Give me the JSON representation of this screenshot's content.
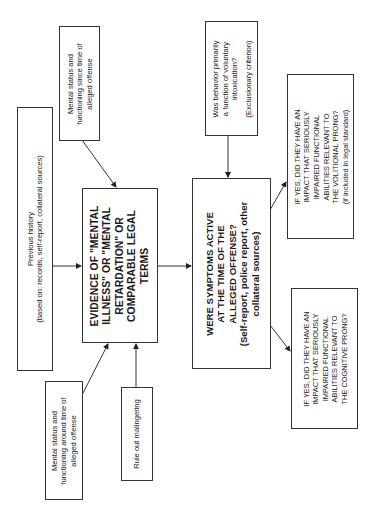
{
  "diagram": {
    "title": "",
    "orientation": "rotated-90-ccw",
    "nodes": {
      "previous_history": {
        "line1": "Previous history",
        "line2": "(based on: records, self-report, collateral sources)"
      },
      "mental_status_around": {
        "line1": "Mental status and",
        "line2": "functioning around time of",
        "line3": "alleged offense"
      },
      "rule_out_malingering": {
        "line1": "Rule out malingering"
      },
      "mental_status_since": {
        "line1": "Mental status and",
        "line2": "functioning since time of",
        "line3": "alleged offense"
      },
      "evidence": {
        "line1": "EVIDENCE OF \"MENTAL",
        "line2": "ILLNESS\" OR \"MENTAL",
        "line3": "RETARDATION\" OR",
        "line4": "COMPARABLE LEGAL",
        "line5": "TERMS"
      },
      "symptoms_active": {
        "line1": "WERE SYMPTOMS ACTIVE",
        "line2": "AT THE TIME OF THE",
        "line3": "ALLEGED OFFENSE?",
        "line4": "(Self-report, police report, other",
        "line5": "collateral sources)"
      },
      "voluntary_intoxication": {
        "line1": "Was behavior primarily",
        "line2": "a function of voluntary",
        "line3": "intoxication?",
        "line4": "(Exclusionary criterion)"
      },
      "volitional_prong": {
        "line1": "IF YES, DID THEY HAVE AN",
        "line2": "IMPACT THAT SERIOUSLY",
        "line3": "IMPAIRED FUNCTIONAL",
        "line4": "ABILITIES RELEVANT TO",
        "line5": "THE VOLITIONAL PRONG?",
        "line6": "(if included in legal standard)"
      },
      "cognitive_prong": {
        "line1": "IF YES, DID THEY HAVE AN",
        "line2": "IMPACT THAT SERIOUSLY",
        "line3": "IMPAIRED FUNCTIONAL",
        "line4": "ABILITIES RELEVANT TO",
        "line5": "THE COGNITIVE PRONG?"
      }
    },
    "edges": [
      {
        "from": "previous_history",
        "to": "evidence"
      },
      {
        "from": "mental_status_around",
        "to": "evidence"
      },
      {
        "from": "rule_out_malingering",
        "to": "evidence"
      },
      {
        "from": "mental_status_since",
        "to": "evidence"
      },
      {
        "from": "evidence",
        "to": "symptoms_active"
      },
      {
        "from": "voluntary_intoxication",
        "to": "symptoms_active"
      },
      {
        "from": "symptoms_active",
        "to": "volitional_prong"
      },
      {
        "from": "symptoms_active",
        "to": "cognitive_prong"
      }
    ],
    "colors": {
      "line": "#333333",
      "text": "#1a1a1a",
      "background": "#ffffff"
    }
  }
}
